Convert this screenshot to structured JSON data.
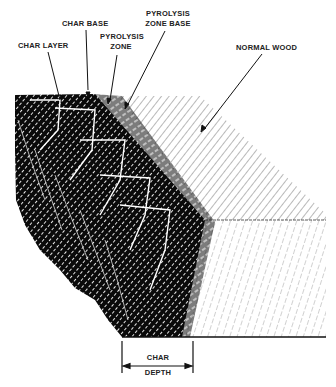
{
  "diagram": {
    "labels": {
      "char_layer": "CHAR LAYER",
      "char_base": "CHAR BASE",
      "pyrolysis_zone_line1": "PYROLYSIS",
      "pyrolysis_zone_line2": "ZONE",
      "pyrolysis_zone_base_line1": "PYROLYSIS",
      "pyrolysis_zone_base_line2": "ZONE BASE",
      "normal_wood": "NORMAL WOOD",
      "char_depth_line1": "CHAR",
      "char_depth_line2": "DEPTH"
    },
    "colors": {
      "ink": "#111111",
      "char": "#0a0a0a",
      "wood_grain": "#6a6a6a",
      "background": "#ffffff"
    }
  }
}
